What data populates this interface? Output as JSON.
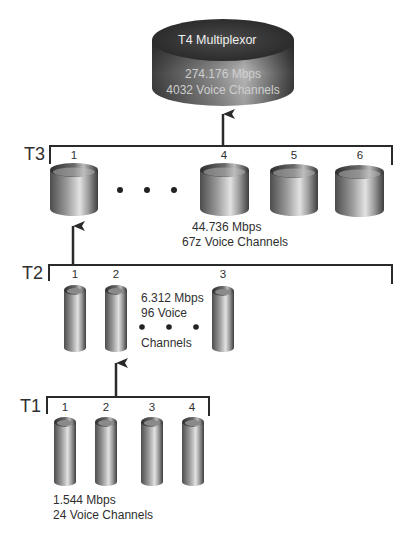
{
  "t4": {
    "title": "T4 Multiplexor",
    "rate": "274.176 Mbps",
    "channels": "4032 Voice Channels"
  },
  "t3": {
    "label": "T3",
    "units": [
      "1",
      "4",
      "5",
      "6"
    ],
    "ellipsis": "• • •",
    "rate": "44.736 Mbps",
    "channels": "67z Voice Channels"
  },
  "t2": {
    "label": "T2",
    "units": [
      "1",
      "2",
      "3"
    ],
    "rate": "6.312 Mbps",
    "channels_line1": "96 Voice",
    "channels_line2": "Channels"
  },
  "t1": {
    "label": "T1",
    "units": [
      "1",
      "2",
      "3",
      "4"
    ],
    "rate": "1.544 Mbps",
    "channels": "24 Voice Channels"
  },
  "colors": {
    "line": "#2a2a2a",
    "cyl_dark": "#4a4a4a",
    "cyl_light": "#d8d8d8",
    "disc_top": "#3a3a3a"
  },
  "icons": [
    "arrow-up-icon",
    "cylinder-icon",
    "tube-icon",
    "disc-icon",
    "dot-icon"
  ]
}
